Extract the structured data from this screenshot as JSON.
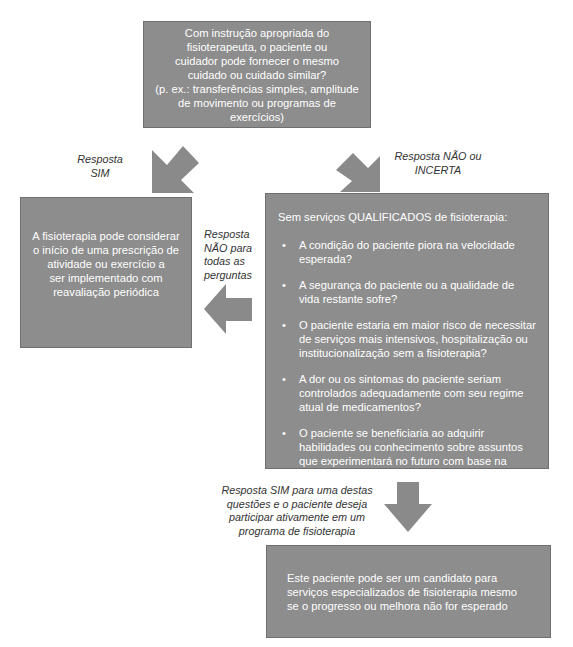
{
  "diagram": {
    "top_box": {
      "lines": [
        "Com instrução apropriada do",
        "fisioterapeuta, o paciente ou",
        "cuidador pode fornecer o mesmo",
        "cuidado ou cuidado similar?",
        "(p. ex.: transferências simples, amplitude",
        "de movimento ou programas de exercícios)"
      ]
    },
    "left_box": {
      "lines": [
        "A fisioterapia pode considerar",
        "o início de uma prescrição de",
        "atividade ou exercício a",
        "ser implementado com",
        "reavaliação periódica"
      ]
    },
    "right_box": {
      "heading": "Sem serviços QUALIFICADOS de fisioterapia:",
      "bullet": "•",
      "questions": [
        "A condição do paciente piora na velocidade esperada?",
        "A segurança do paciente ou a qualidade de vida restante sofre?",
        "O paciente estaria em maior risco de necessitar de serviços mais intensivos, hospitalização ou institucionalização sem a fisioterapia?",
        "A dor ou os sintomas do paciente seriam controlados adequadamente com seu regime atual de medicamentos?",
        "O paciente se beneficiaria ao adquirir habilidades ou conhecimento sobre assuntos que experimentará no futuro com base na trajetória da doença?"
      ]
    },
    "bottom_box": {
      "text": "Este paciente pode ser um candidato para serviços especializados de fisioterapia mesmo se o progresso ou melhora não for esperado"
    },
    "labels": {
      "yes": [
        "Resposta",
        "SIM"
      ],
      "no_or_uncertain": [
        "Resposta NÃO ou",
        "INCERTA"
      ],
      "no_all": [
        "Resposta",
        "NÃO para",
        "todas as",
        "perguntas"
      ],
      "yes_any": [
        "Resposta SIM para uma destas",
        "questões e o paciente deseja",
        "participar ativamente em um",
        "programa de fisioterapia"
      ]
    },
    "colors": {
      "box_fill": "#8d8d8d",
      "arrow_fill": "#8a8a8a",
      "box_text": "#ffffff",
      "label_text": "#333333"
    }
  }
}
